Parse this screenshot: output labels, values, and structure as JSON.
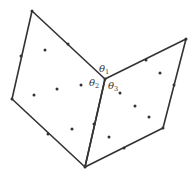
{
  "diagram": {
    "type": "two-quadrilaterals-sharing-edge",
    "labels": [
      {
        "id": "theta1",
        "symbol": "θ",
        "sub": "1",
        "x": 99,
        "y": 72
      },
      {
        "id": "theta2",
        "symbol": "θ",
        "sub": "2",
        "x": 89,
        "y": 86
      },
      {
        "id": "theta3",
        "symbol": "θ",
        "sub": "3",
        "x": 108,
        "y": 89
      }
    ],
    "vertices": {
      "top_left": [
        32,
        11
      ],
      "center": [
        105,
        79
      ],
      "left": [
        12,
        99
      ],
      "bottom": [
        85,
        167
      ],
      "right_top": [
        186,
        39
      ],
      "right_bottom": [
        163,
        128
      ]
    },
    "edge_midpoints": [
      [
        68,
        44
      ],
      [
        21,
        56
      ],
      [
        48,
        134
      ],
      [
        94,
        124
      ],
      [
        146,
        60
      ],
      [
        174,
        85
      ],
      [
        124,
        148
      ]
    ],
    "interior_points": [
      [
        45,
        50
      ],
      [
        34,
        95
      ],
      [
        57,
        89
      ],
      [
        81,
        85
      ],
      [
        72,
        129
      ],
      [
        160,
        73
      ],
      [
        120,
        93
      ],
      [
        135,
        106
      ],
      [
        149,
        117
      ],
      [
        109,
        137
      ]
    ],
    "colors": {
      "stroke": "#333333",
      "background": "#ffffff"
    }
  }
}
